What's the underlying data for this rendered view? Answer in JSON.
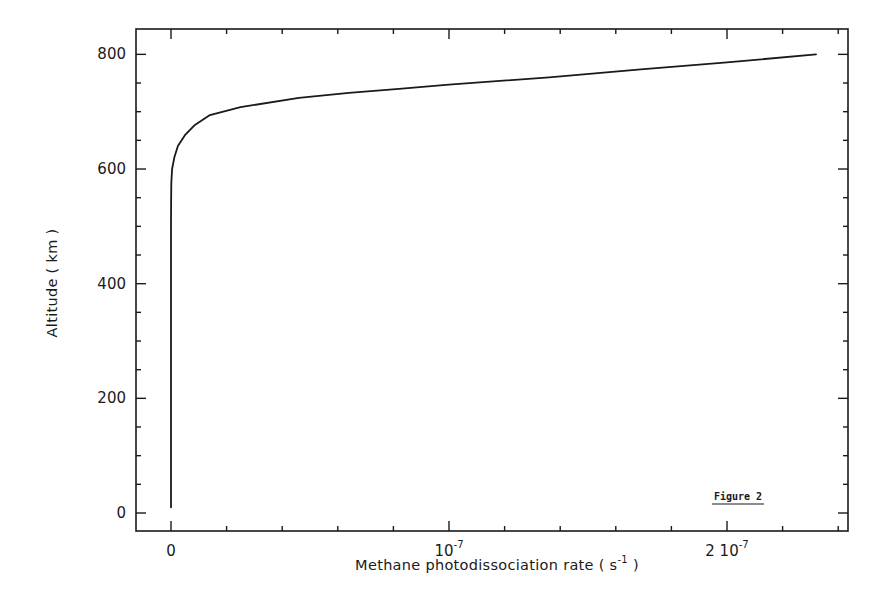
{
  "chart_data": {
    "type": "line",
    "title": "",
    "annotation": "Figure 2",
    "xlabel": "Methane photodissociation rate ( s^-1 )",
    "xlabel_parts": {
      "main": "Methane photodissociation rate ( s",
      "sup": "-1",
      "tail": " )"
    },
    "ylabel": "Altitude ( km )",
    "xlim": [
      -3e-09,
      2.43e-07
    ],
    "ylim": [
      -25,
      840
    ],
    "x_ticks": [
      {
        "value": 0,
        "label": "0"
      },
      {
        "value": 1e-07,
        "label": "10^-7",
        "base": "10",
        "exp": "-7"
      },
      {
        "value": 2e-07,
        "label": "2 10^-7",
        "base": "2 10",
        "exp": "-7"
      }
    ],
    "x_minor_step": 2e-08,
    "y_ticks": [
      0,
      200,
      400,
      600,
      800
    ],
    "y_minor_step": 50,
    "grid": false,
    "legend": null,
    "series": [
      {
        "name": "Methane photodissociation rate",
        "x": [
          0,
          0,
          0,
          0,
          4e-11,
          1e-10,
          4e-10,
          1.2e-09,
          2.5e-09,
          5e-09,
          8.6e-09,
          1.4e-08,
          2.5e-08,
          4.6e-08,
          6.4e-08,
          8.2e-08,
          1e-07,
          1.36e-07,
          1.69e-07,
          2e-07,
          2.32e-07
        ],
        "y": [
          10,
          200,
          400,
          500,
          540,
          575,
          600,
          620,
          640,
          659,
          677,
          694,
          708,
          724,
          733,
          740,
          747,
          760,
          774,
          786,
          800
        ]
      }
    ]
  }
}
